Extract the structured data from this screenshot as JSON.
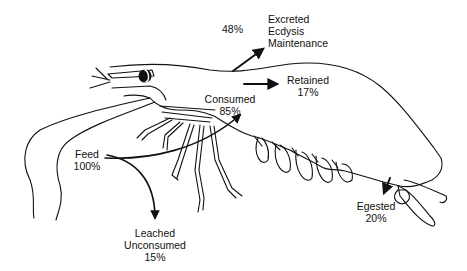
{
  "diagram": {
    "labels": {
      "excreted_pct": "48%",
      "excreted_lines": [
        "Excreted",
        "Ecdysis",
        "Maintenance"
      ],
      "retained_name": "Retained",
      "retained_pct": "17%",
      "consumed_name": "Consumed",
      "consumed_pct": "85%",
      "feed_name": "Feed",
      "feed_pct": "100%",
      "leached_lines": [
        "Leached",
        "Unconsumed"
      ],
      "leached_pct": "15%",
      "egested_name": "Egested",
      "egested_pct": "20%"
    },
    "colors": {
      "line": "#111111",
      "background": "#ffffff"
    }
  }
}
